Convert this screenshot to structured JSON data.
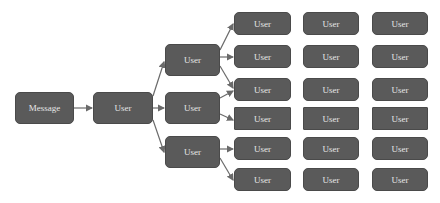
{
  "diagram": {
    "root": {
      "label": "Message"
    },
    "level1": {
      "label": "User"
    },
    "level2": [
      {
        "label": "User"
      },
      {
        "label": "User"
      },
      {
        "label": "User"
      }
    ],
    "grid": [
      [
        "User",
        "User",
        "User"
      ],
      [
        "User",
        "User",
        "User"
      ],
      [
        "User",
        "User",
        "User"
      ],
      [
        "User",
        "User",
        "User"
      ],
      [
        "User",
        "User",
        "User"
      ],
      [
        "User",
        "User",
        "User"
      ]
    ],
    "colors": {
      "node_fill": "#5a5a5a",
      "node_text": "#e6e6e6",
      "edge": "#6a6a6a",
      "background": "#ffffff"
    }
  }
}
